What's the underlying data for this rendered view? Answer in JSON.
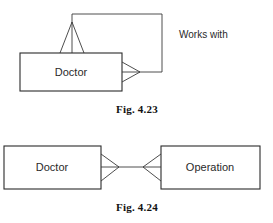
{
  "figures": [
    {
      "id": "fig-4-23",
      "caption": "Fig. 4.23",
      "type": "recursive-relationship",
      "entities": [
        {
          "name": "Doctor",
          "label": "Doctor"
        }
      ],
      "relationships": [
        {
          "label": "Works with",
          "from": "Doctor",
          "to": "Doctor",
          "from_cardinality": "many",
          "to_cardinality": "many",
          "notation": "crows-foot"
        }
      ]
    },
    {
      "id": "fig-4-24",
      "caption": "Fig. 4.24",
      "type": "binary-relationship",
      "entities": [
        {
          "name": "Doctor",
          "label": "Doctor"
        },
        {
          "name": "Operation",
          "label": "Operation"
        }
      ],
      "relationships": [
        {
          "label": "",
          "from": "Doctor",
          "to": "Operation",
          "from_cardinality": "many",
          "to_cardinality": "many",
          "notation": "crows-foot"
        }
      ]
    }
  ],
  "colors": {
    "stroke": "#2b2b2b",
    "line": "#3a3a3a",
    "text": "#2a2a2a",
    "caption": "#111111",
    "background": "#ffffff"
  }
}
